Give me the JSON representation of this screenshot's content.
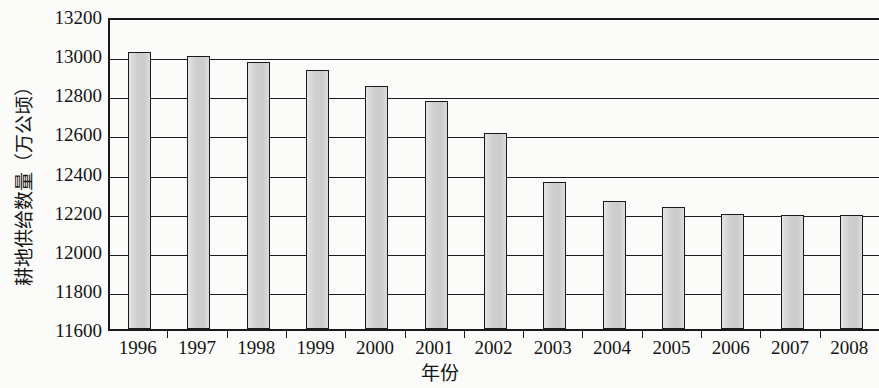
{
  "chart_data": {
    "type": "bar",
    "title": "",
    "xlabel": "年份",
    "ylabel": "耕地供给数量（万公顷）",
    "categories": [
      "1996",
      "1997",
      "1998",
      "1999",
      "2000",
      "2001",
      "2002",
      "2003",
      "2004",
      "2005",
      "2006",
      "2007",
      "2008"
    ],
    "values": [
      13015,
      12995,
      12965,
      12925,
      12840,
      12765,
      12600,
      12350,
      12255,
      12225,
      12190,
      12185,
      12185
    ],
    "series": [
      {
        "name": "耕地供给数量",
        "values": [
          13015,
          12995,
          12965,
          12925,
          12840,
          12765,
          12600,
          12350,
          12255,
          12225,
          12190,
          12185,
          12185
        ]
      }
    ],
    "ylim": [
      11600,
      13200
    ],
    "ytick_labels": [
      "13200",
      "13000",
      "12800",
      "12600",
      "12400",
      "12200",
      "12000",
      "11800",
      "11600"
    ],
    "ytick_values": [
      13200,
      13000,
      12800,
      12600,
      12400,
      12200,
      12000,
      11800,
      11600
    ],
    "ytick_step": 200,
    "grid": true,
    "grid_axis": "y",
    "legend": "none",
    "bar_fill_color": "#d2d2d2",
    "bar_border_color": "#1a1a1a",
    "axis_color": "#1a1a1a",
    "background_color": "#fbfbfa"
  }
}
